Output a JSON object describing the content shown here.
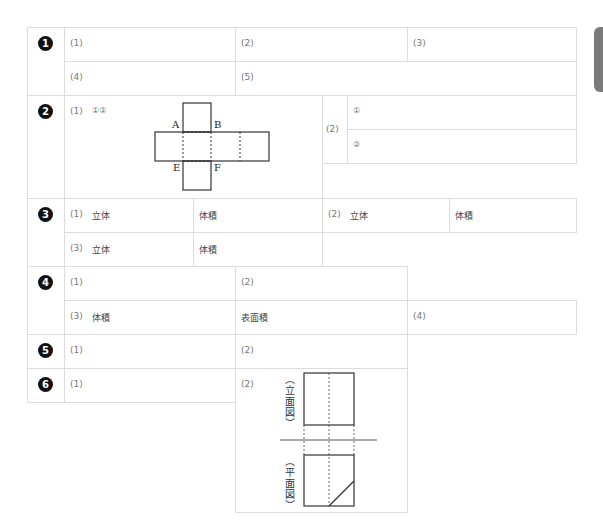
{
  "side_tab": {
    "color": "#7a7a7a"
  },
  "sections": [
    {
      "number": "1",
      "cells": {
        "q1": "(1)",
        "q2": "(2)",
        "q3": "(3)",
        "q4": "(4)",
        "q5": "(5)"
      }
    },
    {
      "number": "2",
      "cells": {
        "q1": "(1)",
        "q1_sub": "①②",
        "q2": "(2)",
        "q2_a": "①",
        "q2_b": "②"
      },
      "figure": {
        "type": "cube-net",
        "labels": {
          "A": "A",
          "B": "B",
          "E": "E",
          "F": "F"
        }
      }
    },
    {
      "number": "3",
      "cells": {
        "q1": "(1)",
        "q1_solid": "立体",
        "q1_volume": "体積",
        "q2": "(2)",
        "q2_solid": "立体",
        "q2_volume": "体積",
        "q3": "(3)",
        "q3_solid": "立体",
        "q3_volume": "体積"
      }
    },
    {
      "number": "4",
      "cells": {
        "q1": "(1)",
        "q2": "(2)",
        "q3": "(3)",
        "q3_volume": "体積",
        "q3_surface": "表面積",
        "q4": "(4)"
      }
    },
    {
      "number": "5",
      "cells": {
        "q1": "(1)",
        "q2": "(2)"
      }
    },
    {
      "number": "6",
      "cells": {
        "q1": "(1)",
        "q2": "(2)"
      },
      "figure": {
        "type": "orthographic-projection",
        "front_label": "（立面図）",
        "plan_label": "（平面図）"
      }
    }
  ]
}
